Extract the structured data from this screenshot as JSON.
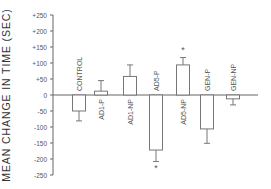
{
  "chart_data": {
    "type": "bar",
    "title": "",
    "xlabel": "",
    "ylabel": "MEAN CHANGE IN TIME (SEC)",
    "ylim": [
      -250,
      250
    ],
    "yticks": [
      250,
      200,
      150,
      100,
      50,
      0,
      -50,
      -100,
      -150,
      -200,
      -250
    ],
    "ytick_labels": [
      "+250",
      "+200",
      "+150",
      "+100",
      "+50",
      "0",
      "-50",
      "-100",
      "-150",
      "-200",
      "-250"
    ],
    "grid": false,
    "legend": null,
    "categories": [
      "CONTROL",
      "AD1-P",
      "AD1-NP",
      "AD5-P",
      "AD5-NP",
      "GEN-P",
      "GEN-NP"
    ],
    "values": [
      -50,
      12,
      58,
      -172,
      94,
      -106,
      -12
    ],
    "error": [
      31,
      33,
      36,
      36,
      23,
      45,
      19
    ],
    "significant": [
      false,
      false,
      false,
      true,
      true,
      false,
      false
    ],
    "annotations": [
      "* marks significant difference (AD5-P, AD5-NP)"
    ]
  },
  "render": {
    "y_zero_px": 95,
    "px_per_unit": 0.32,
    "axis_x": 53,
    "axis_top": 15,
    "axis_bottom": 175,
    "zero_line_end": 258,
    "bar_width": 13,
    "bar_centers": [
      79,
      101,
      130,
      156,
      183,
      207,
      233
    ],
    "significance_marker": "*",
    "colors": {
      "axis": "#666666",
      "bar_stroke": "#777777",
      "bar_fill": "#ffffff",
      "text": "#555555"
    }
  }
}
